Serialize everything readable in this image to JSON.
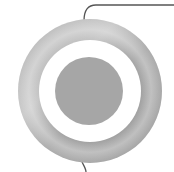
{
  "diagram": {
    "type": "concentric-target",
    "center": [
      90,
      91
    ],
    "rings": [
      {
        "name": "outer-ring",
        "outer_radius": 72,
        "color": "#a9a9a9",
        "highlight": "#d2d2d2"
      },
      {
        "name": "gap-ring",
        "outer_radius": 51,
        "color": "#ffffff"
      },
      {
        "name": "inner-disk",
        "outer_radius": 34,
        "color": "#a6a6a6"
      }
    ],
    "connectors": [
      {
        "name": "top-connector",
        "color": "#555555"
      },
      {
        "name": "bottom-connector",
        "color": "#555555"
      }
    ]
  }
}
